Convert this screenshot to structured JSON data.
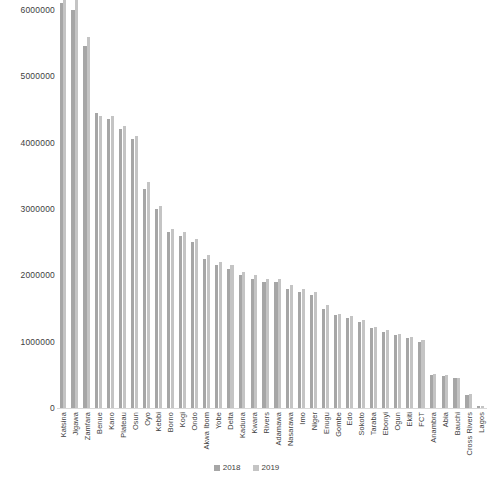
{
  "chart_data": {
    "type": "bar",
    "title": "",
    "subtitle": "",
    "xlabel": "",
    "ylabel": "",
    "ylim": [
      0,
      6000000
    ],
    "ytick_values": [
      0,
      1000000,
      2000000,
      3000000,
      4000000,
      5000000,
      6000000
    ],
    "ytick_labels": [
      "0",
      "1000000",
      "2000000",
      "3000000",
      "4000000",
      "5000000",
      "6000000"
    ],
    "grid": false,
    "legend_position": "bottom-center",
    "categories": [
      "Katsina",
      "Jigawa",
      "Zamfara",
      "Benue",
      "Kano",
      "Plateau",
      "Osun",
      "Oyo",
      "Kebbi",
      "Borno",
      "Kogi",
      "Ondo",
      "Akwa Ibom",
      "Yobe",
      "Delta",
      "Kaduna",
      "Kwara",
      "Rivers",
      "Adamawa",
      "Nasarawa",
      "Imo",
      "Niger",
      "Enugu",
      "Gombe",
      "Edo",
      "Sokoto",
      "Taraba",
      "Ebonyi",
      "Ogun",
      "Ekiti",
      "FCT",
      "Anambra",
      "Abia",
      "Bauchi",
      "Cross Rivers",
      "Lagos"
    ],
    "series": [
      {
        "name": "2018",
        "color": "#a6a6a6",
        "values": [
          6100000,
          6000000,
          5450000,
          4450000,
          4350000,
          4200000,
          4050000,
          3300000,
          3000000,
          2650000,
          2600000,
          2500000,
          2250000,
          2150000,
          2100000,
          2000000,
          1950000,
          1900000,
          1900000,
          1800000,
          1750000,
          1700000,
          1500000,
          1400000,
          1350000,
          1300000,
          1200000,
          1150000,
          1100000,
          1050000,
          1000000,
          500000,
          480000,
          450000,
          200000,
          30000
        ]
      },
      {
        "name": "2019",
        "color": "#c4c4c4",
        "values": [
          6300000,
          6150000,
          5600000,
          4400000,
          4400000,
          4250000,
          4100000,
          3400000,
          3050000,
          2700000,
          2650000,
          2550000,
          2300000,
          2200000,
          2150000,
          2050000,
          2000000,
          1950000,
          1950000,
          1850000,
          1800000,
          1750000,
          1550000,
          1420000,
          1380000,
          1320000,
          1220000,
          1170000,
          1120000,
          1070000,
          1020000,
          520000,
          500000,
          460000,
          210000,
          35000
        ]
      }
    ]
  },
  "legend": {
    "items": [
      {
        "label": "2018",
        "color": "#a6a6a6"
      },
      {
        "label": "2019",
        "color": "#c4c4c4"
      }
    ]
  }
}
